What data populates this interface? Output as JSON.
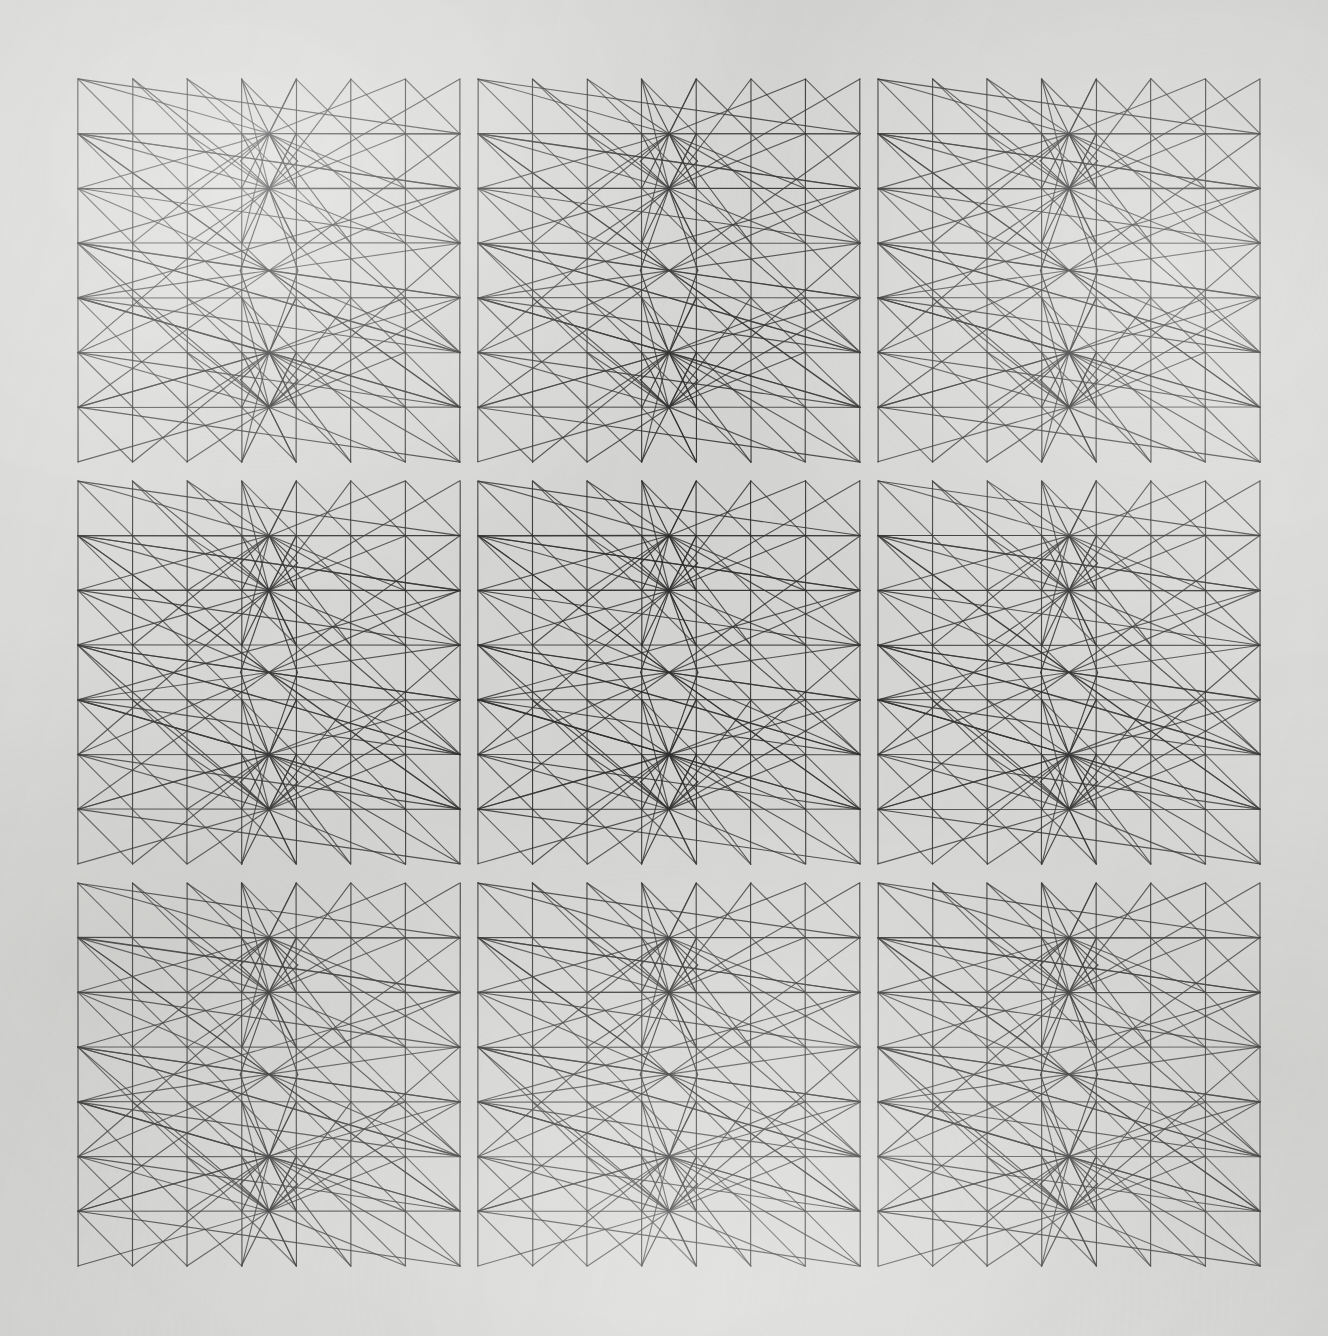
{
  "artwork": {
    "title": "Computer-Generated Plotter Drawing — 3×3 Module Grid",
    "medium": "ink on paper, pen plotter",
    "background_color": "#d9d9d7",
    "ink_color": "#2e2e2e",
    "canvas": {
      "width": 1328,
      "height": 1336
    }
  },
  "layout": {
    "rows": 3,
    "cols": 3,
    "tile_width": 382,
    "tile_height": 383,
    "gap_x": 18,
    "gap_y": 19,
    "origin_x": 78,
    "origin_y": 79,
    "tile_names": [
      "tile-r1c1",
      "tile-r1c2",
      "tile-r1c3",
      "tile-r2c1",
      "tile-r2c2",
      "tile-r2c3",
      "tile-r3c1",
      "tile-r3c2",
      "tile-r3c3"
    ]
  },
  "module": {
    "description": "Each module is built on a lattice of 8 vertical rules and 8 horizontal stations; a zigzag polyline walks the lattice while long chords converge on four nodal points on the vertical axis.",
    "vertical_rules": 8,
    "horizontal_stations": 8,
    "nodal_points": 4,
    "node_rows": [
      1,
      2,
      5,
      6
    ],
    "stroke_width": 1.15,
    "symmetry": "bilateral about vertical centre axis"
  },
  "chart_data": {
    "type": "line",
    "xlabel": "",
    "ylabel": "",
    "grid": false,
    "legend": "none",
    "xlim": [
      0,
      1328
    ],
    "ylim": [
      0,
      1336
    ],
    "tile_grid": {
      "rows": 3,
      "cols": 3
    },
    "module_lattice": {
      "vertical_rule_fractions": [
        0.0,
        0.1428,
        0.2857,
        0.4285,
        0.5714,
        0.7142,
        0.8571,
        1.0
      ],
      "horizontal_station_fractions": [
        0.0,
        0.1428,
        0.2857,
        0.4285,
        0.5714,
        0.7142,
        0.8571,
        1.0
      ],
      "node_fractions_y": [
        0.1428,
        0.2857,
        0.7142,
        0.8571
      ],
      "node_fraction_x": 0.5
    },
    "series": [
      {
        "name": "vertical-rules",
        "count": 8,
        "orientation": "vertical"
      },
      {
        "name": "horizontal-chords",
        "count": 8,
        "orientation": "horizontal"
      },
      {
        "name": "zigzag-polyline",
        "count": 1,
        "vertices": 30
      },
      {
        "name": "node-fan-chords",
        "count": 56,
        "converging_nodes": 4
      },
      {
        "name": "mirror-fan-chords",
        "count": 56,
        "converging_nodes": 4
      }
    ],
    "values": [
      8,
      8,
      30,
      56,
      56
    ]
  }
}
